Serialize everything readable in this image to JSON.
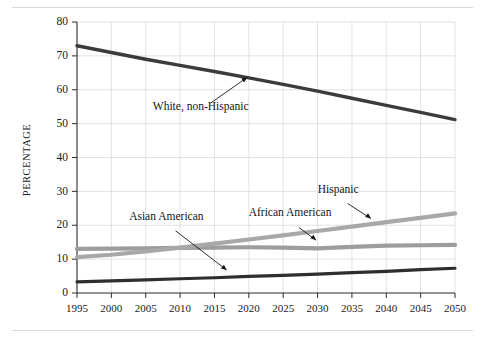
{
  "chart_data": {
    "type": "line",
    "title": "",
    "subtitle": "",
    "xlabel": "",
    "ylabel": "PERCENTAGE",
    "xlim": [
      1995,
      2050
    ],
    "ylim": [
      0,
      80
    ],
    "grid": true,
    "legend_position": "inline-annotations",
    "x": [
      1995,
      2000,
      2005,
      2010,
      2015,
      2020,
      2025,
      2030,
      2035,
      2040,
      2045,
      2050
    ],
    "xtick_labels": [
      "1995",
      "2000",
      "2005",
      "2010",
      "2015",
      "2020",
      "2025",
      "2030",
      "2035",
      "2040",
      "2045",
      "2050"
    ],
    "ytick_labels": [
      "0",
      "10",
      "20",
      "30",
      "40",
      "50",
      "60",
      "70",
      "80"
    ],
    "ytick_values": [
      0,
      10,
      20,
      30,
      40,
      50,
      60,
      70,
      80
    ],
    "series": [
      {
        "name": "White, non-Hispanic",
        "color": "#3b3b3b",
        "width": 3.4,
        "values": [
          73.0,
          71.0,
          69.0,
          67.2,
          65.4,
          63.5,
          61.6,
          59.6,
          57.5,
          55.4,
          53.3,
          51.2
        ],
        "label_x": 2013,
        "label_y": 54,
        "arrow_to_x": 2020,
        "arrow_to_y": 64
      },
      {
        "name": "African American",
        "color": "#9d9d9d",
        "width": 4.2,
        "values": [
          13.0,
          13.1,
          13.2,
          13.3,
          13.4,
          13.5,
          13.4,
          13.2,
          13.6,
          14.0,
          14.1,
          14.2
        ],
        "label_x": 2026,
        "label_y": 22.6,
        "arrow_to_x": 2030,
        "arrow_to_y": 15.2
      },
      {
        "name": "Hispanic",
        "color": "#a8a8a8",
        "width": 4.2,
        "values": [
          10.6,
          11.3,
          12.3,
          13.4,
          14.6,
          15.8,
          17.0,
          18.3,
          19.6,
          20.9,
          22.2,
          23.5
        ],
        "label_x": 2033,
        "label_y": 29.5,
        "arrow_to_x": 2038,
        "arrow_to_y": 21.6
      },
      {
        "name": "Asian American",
        "color": "#2e2e2e",
        "width": 3.2,
        "values": [
          3.3,
          3.6,
          3.9,
          4.2,
          4.5,
          4.9,
          5.2,
          5.6,
          6.0,
          6.4,
          6.9,
          7.3
        ],
        "label_x": 2008,
        "label_y": 21.5,
        "arrow_to_x": 2017,
        "arrow_to_y": 6.4
      }
    ]
  },
  "figure": {
    "rule_color": "#d8d8d8"
  }
}
